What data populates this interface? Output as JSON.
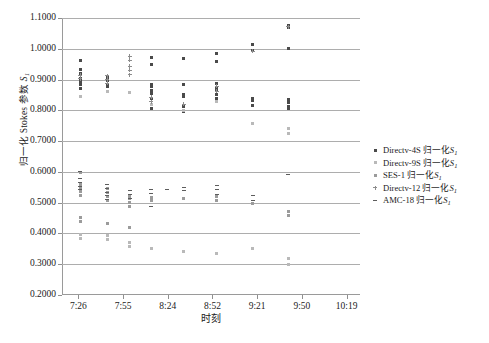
{
  "chart_data": {
    "type": "scatter",
    "title": "",
    "xlabel": "时刻",
    "ylabel": "归一化 Stokes 参数 S",
    "ylabel_sub": "1",
    "ylim": [
      0.2,
      1.1
    ],
    "yticks": [
      "0.2000",
      "0.3000",
      "0.4000",
      "0.5000",
      "0.6000",
      "0.7000",
      "0.8000",
      "0.9000",
      "1.0000",
      "1.1000"
    ],
    "ytick_values": [
      0.2,
      0.3,
      0.4,
      0.5,
      0.6,
      0.7,
      0.8,
      0.9,
      1.0,
      1.1
    ],
    "xticks": [
      "7:26",
      "7:55",
      "8:24",
      "8:52",
      "9:21",
      "9:50",
      "10:19"
    ],
    "xtick_positions": [
      0.055,
      0.205,
      0.355,
      0.505,
      0.655,
      0.805,
      0.955
    ],
    "grid": true,
    "legend_position": "right",
    "series": [
      {
        "name": "Directv-4S 归一化S",
        "name_sub": "1",
        "marker": "diamond",
        "color": "#4a4a4a",
        "points": [
          {
            "x": 0.062,
            "y": 0.962
          },
          {
            "x": 0.062,
            "y": 0.934
          },
          {
            "x": 0.062,
            "y": 0.921
          },
          {
            "x": 0.062,
            "y": 0.905
          },
          {
            "x": 0.062,
            "y": 0.9
          },
          {
            "x": 0.062,
            "y": 0.893
          },
          {
            "x": 0.062,
            "y": 0.884
          },
          {
            "x": 0.062,
            "y": 0.872
          },
          {
            "x": 0.152,
            "y": 0.906
          },
          {
            "x": 0.152,
            "y": 0.898
          },
          {
            "x": 0.152,
            "y": 0.882
          },
          {
            "x": 0.152,
            "y": 0.876
          },
          {
            "x": 0.3,
            "y": 0.972
          },
          {
            "x": 0.3,
            "y": 0.948
          },
          {
            "x": 0.3,
            "y": 0.884
          },
          {
            "x": 0.3,
            "y": 0.876
          },
          {
            "x": 0.3,
            "y": 0.866
          },
          {
            "x": 0.3,
            "y": 0.854
          },
          {
            "x": 0.3,
            "y": 0.838
          },
          {
            "x": 0.3,
            "y": 0.806
          },
          {
            "x": 0.408,
            "y": 0.97
          },
          {
            "x": 0.408,
            "y": 0.884
          },
          {
            "x": 0.408,
            "y": 0.852
          },
          {
            "x": 0.408,
            "y": 0.846
          },
          {
            "x": 0.408,
            "y": 0.812
          },
          {
            "x": 0.408,
            "y": 0.795
          },
          {
            "x": 0.52,
            "y": 0.986
          },
          {
            "x": 0.52,
            "y": 0.96
          },
          {
            "x": 0.52,
            "y": 0.886
          },
          {
            "x": 0.52,
            "y": 0.874
          },
          {
            "x": 0.52,
            "y": 0.866
          },
          {
            "x": 0.52,
            "y": 0.852
          },
          {
            "x": 0.52,
            "y": 0.838
          },
          {
            "x": 0.64,
            "y": 1.014
          },
          {
            "x": 0.64,
            "y": 0.996
          },
          {
            "x": 0.64,
            "y": 0.84
          },
          {
            "x": 0.64,
            "y": 0.832
          },
          {
            "x": 0.64,
            "y": 0.816
          },
          {
            "x": 0.76,
            "y": 1.076
          },
          {
            "x": 0.76,
            "y": 1.068
          },
          {
            "x": 0.76,
            "y": 1.0
          },
          {
            "x": 0.76,
            "y": 0.836
          },
          {
            "x": 0.76,
            "y": 0.824
          },
          {
            "x": 0.76,
            "y": 0.812
          },
          {
            "x": 0.76,
            "y": 0.806
          }
        ]
      },
      {
        "name": "Directv-9S 归一化S",
        "name_sub": "1",
        "marker": "square",
        "color": "#b9b9b9",
        "points": [
          {
            "x": 0.062,
            "y": 0.846
          },
          {
            "x": 0.152,
            "y": 0.86
          },
          {
            "x": 0.228,
            "y": 0.858
          },
          {
            "x": 0.3,
            "y": 0.82
          },
          {
            "x": 0.408,
            "y": 0.8
          },
          {
            "x": 0.52,
            "y": 0.828
          },
          {
            "x": 0.64,
            "y": 0.756
          },
          {
            "x": 0.76,
            "y": 0.74
          },
          {
            "x": 0.76,
            "y": 0.726
          },
          {
            "x": 0.062,
            "y": 0.398
          },
          {
            "x": 0.062,
            "y": 0.384
          },
          {
            "x": 0.152,
            "y": 0.392
          },
          {
            "x": 0.152,
            "y": 0.38
          },
          {
            "x": 0.228,
            "y": 0.372
          },
          {
            "x": 0.228,
            "y": 0.358
          },
          {
            "x": 0.3,
            "y": 0.352
          },
          {
            "x": 0.408,
            "y": 0.34
          },
          {
            "x": 0.52,
            "y": 0.336
          },
          {
            "x": 0.64,
            "y": 0.352
          },
          {
            "x": 0.76,
            "y": 0.318
          },
          {
            "x": 0.76,
            "y": 0.3
          }
        ]
      },
      {
        "name": "SES-1 归一化S",
        "name_sub": "1",
        "marker": "x",
        "color": "#9b9b9b",
        "points": [
          {
            "x": 0.062,
            "y": 0.598
          },
          {
            "x": 0.062,
            "y": 0.56
          },
          {
            "x": 0.062,
            "y": 0.548
          },
          {
            "x": 0.062,
            "y": 0.536
          },
          {
            "x": 0.062,
            "y": 0.524
          },
          {
            "x": 0.152,
            "y": 0.546
          },
          {
            "x": 0.152,
            "y": 0.534
          },
          {
            "x": 0.152,
            "y": 0.52
          },
          {
            "x": 0.152,
            "y": 0.508
          },
          {
            "x": 0.228,
            "y": 0.524
          },
          {
            "x": 0.228,
            "y": 0.512
          },
          {
            "x": 0.228,
            "y": 0.5
          },
          {
            "x": 0.228,
            "y": 0.486
          },
          {
            "x": 0.3,
            "y": 0.518
          },
          {
            "x": 0.3,
            "y": 0.506
          },
          {
            "x": 0.408,
            "y": 0.512
          },
          {
            "x": 0.52,
            "y": 0.52
          },
          {
            "x": 0.52,
            "y": 0.506
          },
          {
            "x": 0.64,
            "y": 0.496
          },
          {
            "x": 0.76,
            "y": 0.47
          },
          {
            "x": 0.76,
            "y": 0.458
          },
          {
            "x": 0.062,
            "y": 0.452
          },
          {
            "x": 0.062,
            "y": 0.44
          },
          {
            "x": 0.152,
            "y": 0.432
          },
          {
            "x": 0.228,
            "y": 0.418
          }
        ]
      },
      {
        "name": "Directv-12 归一化S",
        "name_sub": "1",
        "marker": "plus",
        "color": "#8d8d8d",
        "points": [
          {
            "x": 0.228,
            "y": 0.976
          },
          {
            "x": 0.228,
            "y": 0.962
          },
          {
            "x": 0.228,
            "y": 0.944
          },
          {
            "x": 0.228,
            "y": 0.93
          },
          {
            "x": 0.228,
            "y": 0.916
          },
          {
            "x": 0.152,
            "y": 0.912
          },
          {
            "x": 0.152,
            "y": 0.9
          },
          {
            "x": 0.152,
            "y": 0.888
          },
          {
            "x": 0.062,
            "y": 0.914
          },
          {
            "x": 0.062,
            "y": 0.902
          },
          {
            "x": 0.3,
            "y": 0.842
          },
          {
            "x": 0.3,
            "y": 0.828
          },
          {
            "x": 0.408,
            "y": 0.82
          },
          {
            "x": 0.52,
            "y": 0.878
          },
          {
            "x": 0.52,
            "y": 0.862
          },
          {
            "x": 0.64,
            "y": 0.992
          },
          {
            "x": 0.76,
            "y": 1.072
          }
        ]
      },
      {
        "name": "AMC-18 归一化S",
        "name_sub": "1",
        "marker": "dash",
        "color": "#5c5c5c",
        "points": [
          {
            "x": 0.062,
            "y": 0.6
          },
          {
            "x": 0.062,
            "y": 0.578
          },
          {
            "x": 0.062,
            "y": 0.566
          },
          {
            "x": 0.062,
            "y": 0.554
          },
          {
            "x": 0.062,
            "y": 0.542
          },
          {
            "x": 0.152,
            "y": 0.558
          },
          {
            "x": 0.152,
            "y": 0.546
          },
          {
            "x": 0.152,
            "y": 0.534
          },
          {
            "x": 0.152,
            "y": 0.522
          },
          {
            "x": 0.152,
            "y": 0.51
          },
          {
            "x": 0.228,
            "y": 0.538
          },
          {
            "x": 0.228,
            "y": 0.526
          },
          {
            "x": 0.228,
            "y": 0.514
          },
          {
            "x": 0.3,
            "y": 0.544
          },
          {
            "x": 0.3,
            "y": 0.53
          },
          {
            "x": 0.408,
            "y": 0.55
          },
          {
            "x": 0.408,
            "y": 0.538
          },
          {
            "x": 0.52,
            "y": 0.556
          },
          {
            "x": 0.52,
            "y": 0.542
          },
          {
            "x": 0.52,
            "y": 0.528
          },
          {
            "x": 0.64,
            "y": 0.524
          },
          {
            "x": 0.64,
            "y": 0.508
          },
          {
            "x": 0.76,
            "y": 0.59
          },
          {
            "x": 0.352,
            "y": 0.544
          },
          {
            "x": 0.3,
            "y": 0.486
          }
        ]
      }
    ]
  },
  "axes": {
    "y_title_main": "归一化 Stokes 参数 ",
    "y_title_italic": "S",
    "y_title_sub": "1",
    "x_title": "时刻"
  },
  "legend": {
    "items": [
      {
        "key": "+",
        "text": "Directv-4S 归一化",
        "italic": "S",
        "sub": "1"
      },
      {
        "key": "▪",
        "text": "Directv-9S 归一化",
        "italic": "S",
        "sub": "1"
      },
      {
        "key": "×",
        "text": "SES-1 归一化",
        "italic": "S",
        "sub": "1"
      },
      {
        "key": "+",
        "text": "Directv-12 归一化",
        "italic": "S",
        "sub": "1"
      },
      {
        "key": "–",
        "text": "AMC-18 归一化",
        "italic": "S",
        "sub": "1"
      }
    ]
  }
}
